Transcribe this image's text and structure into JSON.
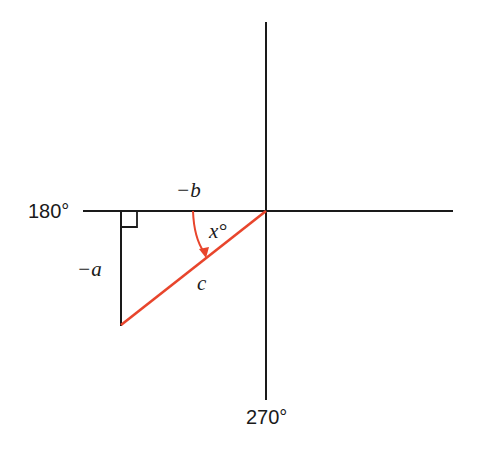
{
  "diagram": {
    "title": "",
    "type": "reference triangle in third quadrant",
    "colors": {
      "axes": "#1a1a1a",
      "legs": "#1a1a1a",
      "hypotenuse": "#E8452C",
      "angle_arc": "#E8452C",
      "background": "#ffffff"
    },
    "labels": {
      "axis_left": "180°",
      "axis_bottom": "270°",
      "horizontal_leg": "−b",
      "vertical_leg": "−a",
      "hypotenuse": "c",
      "angle": "x°"
    },
    "geometry": {
      "origin": [
        266,
        211
      ],
      "horizontal_axis": [
        83,
        453
      ],
      "vertical_axis": [
        22,
        400
      ],
      "triangle_vertices": [
        [
          266,
          211
        ],
        [
          121,
          211
        ],
        [
          121,
          325
        ]
      ],
      "right_angle_marker_size": 16
    }
  }
}
